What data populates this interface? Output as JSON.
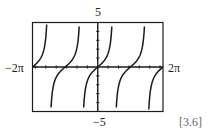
{
  "chart_data": {
    "type": "line",
    "function": "tan(x)",
    "title": "",
    "xlabel": "",
    "ylabel": "",
    "xlim": [
      -6.2832,
      6.2832
    ],
    "ylim": [
      -5,
      5
    ],
    "x_range_labels": {
      "min": "−2π",
      "max": "2π"
    },
    "y_range_labels": {
      "min": "−5",
      "max": "5"
    },
    "x_tick_step": 1,
    "y_tick_step": 1,
    "zeros": [
      -6.2832,
      -3.1416,
      0,
      3.1416,
      6.2832
    ],
    "asymptotes": [
      -4.7124,
      -1.5708,
      1.5708,
      4.7124
    ],
    "grid": false,
    "legend": null,
    "series": [
      {
        "name": "y = tan x",
        "color": "#1a1a1a"
      }
    ]
  },
  "labels": {
    "y_max": "5",
    "y_min": "−5",
    "x_min": "−2π",
    "x_max": "2π",
    "caption": "[3.6]"
  },
  "colors": {
    "curve": "#1a1a1a",
    "frame": "#1a1a1a",
    "background": "#ffffff"
  }
}
